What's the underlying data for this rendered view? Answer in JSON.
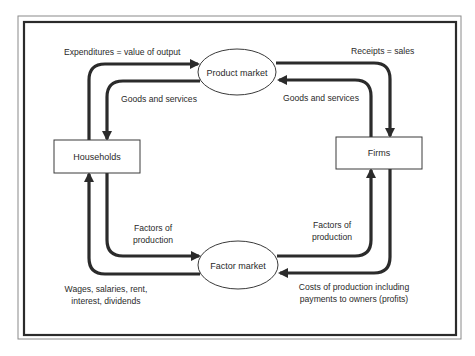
{
  "diagram": {
    "nodes": {
      "product_market": "Product market",
      "factor_market": "Factor market",
      "households": "Households",
      "firms": "Firms"
    },
    "flows": {
      "expenditures": "Expenditures = value of output",
      "receipts": "Receipts = sales",
      "goods_to_households": "Goods and services",
      "goods_from_firms": "Goods and services",
      "factors_from_households": [
        "Factors of",
        "production"
      ],
      "factors_to_firms": [
        "Factors of",
        "production"
      ],
      "wages": [
        "Wages, salaries, rent,",
        "interest, dividends"
      ],
      "costs": [
        "Costs of production including",
        "payments to owners (profits)"
      ]
    }
  }
}
